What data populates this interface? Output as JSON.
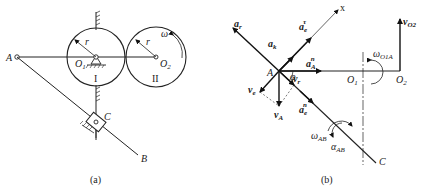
{
  "panel_a": {
    "caption": "(a)",
    "labels": {
      "A": "A",
      "B": "B",
      "C": "C",
      "O1": "O",
      "O1_sub": "1",
      "O2": "O",
      "O2_sub": "2",
      "r1": "r",
      "r2": "r",
      "omega": "ω",
      "gear1": "I",
      "gear2": "II"
    }
  },
  "panel_b": {
    "caption": "(b)",
    "labels": {
      "A": "A",
      "C": "C",
      "x": "x",
      "O1": "O",
      "O1_sub": "1",
      "O2": "O",
      "O2_sub": "2",
      "phi": "φ",
      "a_r": "a",
      "a_r_sub": "r",
      "a_k": "a",
      "a_k_sub": "k",
      "a_e_tau": "a",
      "a_e_tau_sub": "e",
      "a_e_tau_sup": "τ",
      "a_e_n": "a",
      "a_e_n_sub": "e",
      "a_e_n_sup": "n",
      "a_A_n": "a",
      "a_A_n_sub": "A",
      "a_A_n_sup": "n",
      "v_e": "v",
      "v_e_sub": "e",
      "v_r": "v",
      "v_r_sub": "r",
      "v_A": "v",
      "v_A_sub": "A",
      "v_O2": "v",
      "v_O2_sub": "O2",
      "omega_O1A": "ω",
      "omega_O1A_sub": "O1A",
      "omega_AB": "ω",
      "omega_AB_sub": "AB",
      "alpha_AB": "α",
      "alpha_AB_sub": "AB"
    }
  }
}
